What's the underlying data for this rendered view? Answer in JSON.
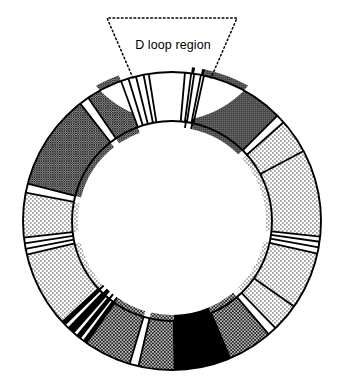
{
  "figure": {
    "title": "",
    "annotations": [
      {
        "id": "d-loop-callout",
        "text": "D loop region",
        "style": "dotted-trapezoid-callout"
      }
    ],
    "colors": {
      "outline": "#000000",
      "background": "#ffffff",
      "black_segment": "#000000",
      "dark_gray_segment": "#5a5a5a",
      "medium_crosshatch": "#8f8f8f",
      "light_stipple": "#d9d9d9",
      "white_segment": "#ffffff"
    },
    "geometry": {
      "center_x": 172,
      "center_y": 221,
      "outer_radius": 149,
      "inner_radius": 100,
      "stroke_width": 1.8
    },
    "callout": {
      "apex_left_x": 133,
      "apex_right_x": 211,
      "apex_y": 78,
      "top_left_x": 107,
      "top_right_x": 237,
      "top_y": 18,
      "dash_pattern": "1.6 2.6"
    },
    "chart_data": {
      "type": "pie",
      "title": "Circular genome map with D loop region",
      "units": "degrees (clockwise from 12 o'clock)",
      "segments": [
        {
          "name": "D loop region",
          "start": 351.0,
          "end": 5.0,
          "fill": "white",
          "label": "D loop region"
        },
        {
          "name": "stripe-gap-1",
          "start": 5.0,
          "end": 7.4,
          "fill": "white"
        },
        {
          "name": "stripe-line-1",
          "start": 7.4,
          "end": 8.6,
          "fill": "black"
        },
        {
          "name": "stripe-gap-2",
          "start": 8.6,
          "end": 11.2,
          "fill": "white"
        },
        {
          "name": "stripe-line-2",
          "start": 11.2,
          "end": 12.4,
          "fill": "black"
        },
        {
          "name": "dark-gray-block",
          "start": 12.4,
          "end": 45.0,
          "fill": "dark_gray"
        },
        {
          "name": "stripe-gap-3",
          "start": 45.0,
          "end": 48.5,
          "fill": "white"
        },
        {
          "name": "light-stipple-a",
          "start": 48.5,
          "end": 62.0,
          "fill": "light_stipple"
        },
        {
          "name": "light-stipple-b",
          "start": 62.0,
          "end": 96.0,
          "fill": "light_stipple"
        },
        {
          "name": "stripe-gap-4",
          "start": 96.0,
          "end": 98.0,
          "fill": "white"
        },
        {
          "name": "stripe-gap-5",
          "start": 98.0,
          "end": 100.2,
          "fill": "white"
        },
        {
          "name": "stripe-gap-6",
          "start": 100.2,
          "end": 102.6,
          "fill": "white"
        },
        {
          "name": "light-stipple-c",
          "start": 102.6,
          "end": 125.0,
          "fill": "light_stipple"
        },
        {
          "name": "light-stipple-d",
          "start": 125.0,
          "end": 136.0,
          "fill": "light_stipple"
        },
        {
          "name": "stripe-gap-7",
          "start": 136.0,
          "end": 139.5,
          "fill": "white"
        },
        {
          "name": "medium-crosshatch-a",
          "start": 139.5,
          "end": 157.0,
          "fill": "medium_crosshatch"
        },
        {
          "name": "black-block-bottom",
          "start": 157.0,
          "end": 179.0,
          "fill": "black"
        },
        {
          "name": "medium-crosshatch-b",
          "start": 179.0,
          "end": 193.0,
          "fill": "medium_crosshatch"
        },
        {
          "name": "stripe-gap-8",
          "start": 193.0,
          "end": 196.5,
          "fill": "white"
        },
        {
          "name": "medium-crosshatch-c",
          "start": 196.5,
          "end": 215.0,
          "fill": "medium_crosshatch"
        },
        {
          "name": "stripe-band-line-1",
          "start": 215.0,
          "end": 216.4,
          "fill": "black"
        },
        {
          "name": "stripe-band-gap-1",
          "start": 216.4,
          "end": 218.2,
          "fill": "white"
        },
        {
          "name": "stripe-band-line-2",
          "start": 218.2,
          "end": 219.6,
          "fill": "black"
        },
        {
          "name": "stripe-band-gap-2",
          "start": 219.6,
          "end": 221.4,
          "fill": "white"
        },
        {
          "name": "stripe-band-thick-black",
          "start": 221.4,
          "end": 224.0,
          "fill": "black"
        },
        {
          "name": "stripe-band-gap-3",
          "start": 224.0,
          "end": 226.0,
          "fill": "white"
        },
        {
          "name": "stripe-band-line-3",
          "start": 226.0,
          "end": 227.4,
          "fill": "black"
        },
        {
          "name": "light-stipple-e",
          "start": 227.4,
          "end": 257.0,
          "fill": "light_stipple"
        },
        {
          "name": "stripe-gap-9",
          "start": 257.0,
          "end": 259.2,
          "fill": "white"
        },
        {
          "name": "stripe-gap-10",
          "start": 259.2,
          "end": 261.4,
          "fill": "white"
        },
        {
          "name": "stripe-gap-11",
          "start": 261.4,
          "end": 263.6,
          "fill": "white"
        },
        {
          "name": "light-stipple-f",
          "start": 263.6,
          "end": 281.0,
          "fill": "light_stipple"
        },
        {
          "name": "stripe-gap-12",
          "start": 281.0,
          "end": 284.5,
          "fill": "white"
        },
        {
          "name": "dense-crosshatch-a",
          "start": 284.5,
          "end": 322.0,
          "fill": "dense_crosshatch"
        },
        {
          "name": "stripe-gap-13",
          "start": 322.0,
          "end": 325.8,
          "fill": "white"
        },
        {
          "name": "dense-crosshatch-b",
          "start": 325.8,
          "end": 340.0,
          "fill": "dense_crosshatch"
        },
        {
          "name": "stripe-gap-14",
          "start": 340.0,
          "end": 343.0,
          "fill": "white"
        },
        {
          "name": "stripe-gap-15",
          "start": 343.0,
          "end": 346.0,
          "fill": "white"
        },
        {
          "name": "stripe-gap-16",
          "start": 346.0,
          "end": 349.0,
          "fill": "white"
        }
      ]
    }
  }
}
